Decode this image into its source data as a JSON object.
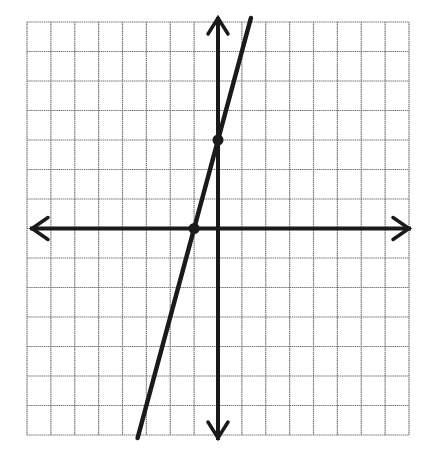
{
  "chart_data": {
    "type": "line",
    "title": "",
    "xlabel": "",
    "ylabel": "",
    "grid": true,
    "xlim": [
      -8,
      8
    ],
    "ylim": [
      -7,
      7
    ],
    "grid_columns": 16,
    "grid_rows": 14,
    "axes": {
      "x_axis_arrows": true,
      "y_axis_arrows": true
    },
    "series": [
      {
        "name": "line",
        "equation": "y = 3x + 3",
        "slope": 3,
        "intercept": 3,
        "points": [
          {
            "x": -1,
            "y": 0
          },
          {
            "x": 0,
            "y": 3
          }
        ]
      }
    ],
    "colors": {
      "grid": "#777777",
      "axis": "#1a1a1a",
      "line": "#1a1a1a",
      "background": "#ffffff"
    }
  }
}
